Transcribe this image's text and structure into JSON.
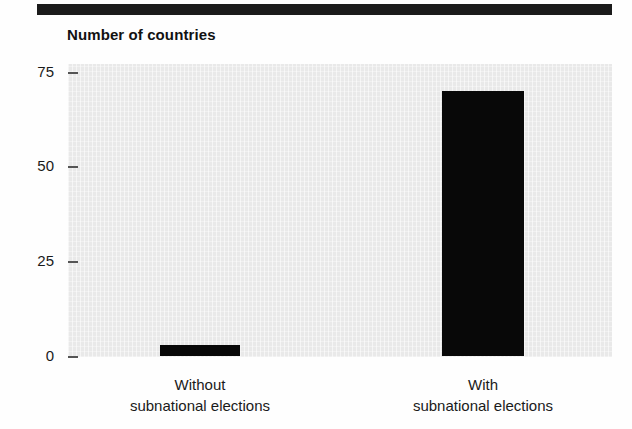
{
  "figure": {
    "title": "Number of countries",
    "header_rule": "decorative-black-rule",
    "colors": {
      "bar": "#080808",
      "panel": "#e9e9e9",
      "text": "#1a1a1a",
      "rule": "#1b1b1b"
    }
  },
  "chart_data": {
    "type": "bar",
    "title": "Number of countries",
    "xlabel": "",
    "ylabel": "Number of countries",
    "categories": [
      "Without subnational elections",
      "With subnational elections"
    ],
    "category_lines": [
      {
        "line1": "Without",
        "line2": "subnational elections"
      },
      {
        "line1": "With",
        "line2": "subnational elections"
      }
    ],
    "values": [
      3,
      70
    ],
    "ylim": [
      0,
      75
    ],
    "yticks": [
      0,
      25,
      50,
      75
    ],
    "ytick_labels": [
      "0",
      "25",
      "50",
      "75"
    ],
    "grid": false,
    "legend": "none",
    "series": [
      {
        "name": "Number of countries",
        "values": [
          3,
          70
        ]
      }
    ]
  },
  "axis": {
    "y": {
      "t75": "75",
      "t50": "50",
      "t25": "25",
      "t0": "0"
    },
    "x": {
      "cat1_line1": "Without",
      "cat1_line2": "subnational elections",
      "cat2_line1": "With",
      "cat2_line2": "subnational elections"
    }
  }
}
